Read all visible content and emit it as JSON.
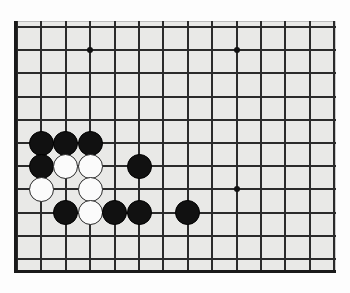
{
  "scene": {
    "title": "Go board position",
    "board_label": "goban",
    "background_color": "#ffffff",
    "board_color": "#e9e9e7",
    "line_color": "#2b2b2b",
    "border_color": "#1a1a1a",
    "black_stone_color": "#111111",
    "white_stone_color": "#fbfbfb",
    "white_stone_outline": "#2a2a2a"
  },
  "board": {
    "visible_columns": 14,
    "visible_rows": 11,
    "origin_x": 3,
    "origin_y": 6,
    "spacing_x": 24.4,
    "spacing_y": 23.2,
    "star_points": [
      {
        "col": 3,
        "row": 1,
        "name": "star-point-upper-left"
      },
      {
        "col": 9,
        "row": 1,
        "name": "star-point-upper-right"
      },
      {
        "col": 9,
        "row": 7,
        "name": "star-point-lower-right"
      }
    ]
  },
  "stones": [
    {
      "col": 1,
      "row": 5,
      "color": "black",
      "label": "black-stone-1"
    },
    {
      "col": 2,
      "row": 5,
      "color": "black",
      "label": "black-stone-2"
    },
    {
      "col": 3,
      "row": 5,
      "color": "black",
      "label": "black-stone-3"
    },
    {
      "col": 1,
      "row": 6,
      "color": "black",
      "label": "black-stone-4"
    },
    {
      "col": 2,
      "row": 6,
      "color": "white",
      "label": "white-stone-1"
    },
    {
      "col": 3,
      "row": 6,
      "color": "white",
      "label": "white-stone-2"
    },
    {
      "col": 5,
      "row": 6,
      "color": "black",
      "label": "black-stone-5"
    },
    {
      "col": 1,
      "row": 7,
      "color": "white",
      "label": "white-stone-3"
    },
    {
      "col": 3,
      "row": 7,
      "color": "white",
      "label": "white-stone-4"
    },
    {
      "col": 2,
      "row": 8,
      "color": "black",
      "label": "black-stone-6"
    },
    {
      "col": 3,
      "row": 8,
      "color": "white",
      "label": "white-stone-5"
    },
    {
      "col": 4,
      "row": 8,
      "color": "black",
      "label": "black-stone-7"
    },
    {
      "col": 5,
      "row": 8,
      "color": "black",
      "label": "black-stone-8"
    },
    {
      "col": 7,
      "row": 8,
      "color": "black",
      "label": "black-stone-9"
    }
  ],
  "counts": {
    "black_stones": 9,
    "white_stones": 5,
    "total_stones": 14
  }
}
